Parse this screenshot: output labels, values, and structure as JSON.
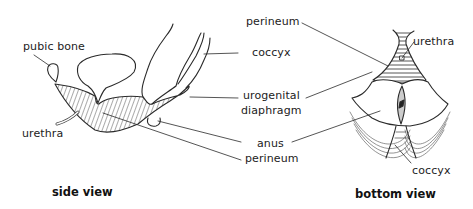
{
  "diagram": {
    "type": "anatomical illustration",
    "colors": {
      "line": "#2a2a2a",
      "background": "#ffffff"
    }
  },
  "side_view": {
    "caption": "side view",
    "labels": {
      "pubic_bone": "pubic bone",
      "urethra": "urethra",
      "coccyx": "coccyx",
      "urogenital_line1": "urogenital",
      "urogenital_line2": "diaphragm",
      "anus": "anus",
      "perineum": "perineum"
    }
  },
  "bottom_view": {
    "caption": "bottom view",
    "labels": {
      "perineum": "perineum",
      "urethra": "urethra",
      "coccyx": "coccyx"
    }
  }
}
